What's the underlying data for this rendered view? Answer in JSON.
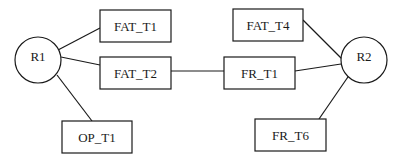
{
  "diagram": {
    "nodes": [
      {
        "id": "R1",
        "label": "R1",
        "shape": "circle",
        "cx": 38,
        "cy": 60,
        "r": 23
      },
      {
        "id": "R2",
        "label": "R2",
        "shape": "circle",
        "cx": 364,
        "cy": 60,
        "r": 23
      },
      {
        "id": "FAT_T1",
        "label": "FAT_T1",
        "shape": "rect",
        "x": 100,
        "y": 10,
        "w": 71,
        "h": 32
      },
      {
        "id": "FAT_T2",
        "label": "FAT_T2",
        "shape": "rect",
        "x": 100,
        "y": 57,
        "w": 71,
        "h": 32
      },
      {
        "id": "OP_T1",
        "label": "OP_T1",
        "shape": "rect",
        "x": 62,
        "y": 121,
        "w": 70,
        "h": 32
      },
      {
        "id": "FAT_T4",
        "label": "FAT_T4",
        "shape": "rect",
        "x": 233,
        "y": 9,
        "w": 70,
        "h": 32
      },
      {
        "id": "FR_T1",
        "label": "FR_T1",
        "shape": "rect",
        "x": 224,
        "y": 57,
        "w": 71,
        "h": 32
      },
      {
        "id": "FR_T6",
        "label": "FR_T6",
        "shape": "rect",
        "x": 255,
        "y": 119,
        "w": 71,
        "h": 32
      }
    ],
    "edges": [
      {
        "from": "R1",
        "to": "FAT_T1",
        "x1": 58,
        "y1": 50,
        "x2": 100,
        "y2": 28
      },
      {
        "from": "R1",
        "to": "FAT_T2",
        "x1": 61,
        "y1": 57,
        "x2": 100,
        "y2": 65
      },
      {
        "from": "R1",
        "to": "OP_T1",
        "x1": 57,
        "y1": 75,
        "x2": 92,
        "y2": 121
      },
      {
        "from": "FAT_T2",
        "to": "FR_T1",
        "x1": 171,
        "y1": 71,
        "x2": 224,
        "y2": 71
      },
      {
        "from": "FAT_T4",
        "to": "R2",
        "x1": 303,
        "y1": 20,
        "x2": 343,
        "y2": 60
      },
      {
        "from": "FR_T1",
        "to": "R2",
        "x1": 295,
        "y1": 71,
        "x2": 341,
        "y2": 64
      },
      {
        "from": "R2",
        "to": "FR_T6",
        "x1": 350,
        "y1": 74,
        "x2": 319,
        "y2": 119
      }
    ]
  },
  "colors": {
    "stroke": "#1a1a1a",
    "background": "#ffffff"
  }
}
